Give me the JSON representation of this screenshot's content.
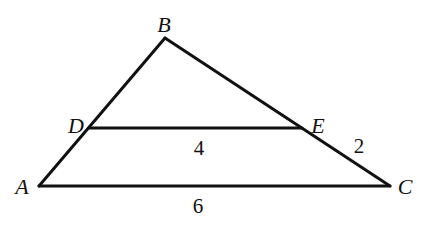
{
  "figure": {
    "type": "triangle-with-parallel-segment",
    "points": {
      "A": {
        "label": "A",
        "x": 39,
        "y": 186
      },
      "B": {
        "label": "B",
        "x": 165,
        "y": 38
      },
      "C": {
        "label": "C",
        "x": 390,
        "y": 186
      },
      "D": {
        "label": "D",
        "x": 89,
        "y": 128
      },
      "E": {
        "label": "E",
        "x": 302,
        "y": 128
      }
    },
    "segments": [
      {
        "name": "AB",
        "from": "A",
        "to": "B"
      },
      {
        "name": "BC",
        "from": "B",
        "to": "C"
      },
      {
        "name": "AC",
        "from": "A",
        "to": "C"
      },
      {
        "name": "DE",
        "from": "D",
        "to": "E"
      }
    ],
    "lengths": {
      "DE": "4",
      "EC": "2",
      "AC": "6"
    },
    "colors": {
      "stroke": "#111111",
      "background": "#ffffff"
    }
  }
}
